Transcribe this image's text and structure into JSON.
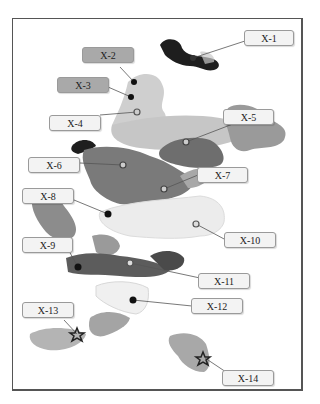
{
  "map": {
    "type": "schematic-region-map",
    "colors": {
      "black": "#1e1e1e",
      "dark_gray": "#6e6e6e",
      "mid_gray": "#8c8c8c",
      "light_gray": "#b4b4b4",
      "pale_gray": "#d2d2d2",
      "very_pale": "#ececec"
    },
    "markers": [
      {
        "id": "X-1",
        "label": "X-1",
        "symbol": "dark-circle",
        "label_style": "light"
      },
      {
        "id": "X-2",
        "label": "X-2",
        "symbol": "black-dot",
        "label_style": "dark"
      },
      {
        "id": "X-3",
        "label": "X-3",
        "symbol": "black-dot",
        "label_style": "dark"
      },
      {
        "id": "X-4",
        "label": "X-4",
        "symbol": "ring",
        "label_style": "light"
      },
      {
        "id": "X-5",
        "label": "X-5",
        "symbol": "ring",
        "label_style": "light"
      },
      {
        "id": "X-6",
        "label": "X-6",
        "symbol": "ring",
        "label_style": "light"
      },
      {
        "id": "X-7",
        "label": "X-7",
        "symbol": "ring",
        "label_style": "light"
      },
      {
        "id": "X-8",
        "label": "X-8",
        "symbol": "black-dot",
        "label_style": "light"
      },
      {
        "id": "X-9",
        "label": "X-9",
        "symbol": "black-dot",
        "label_style": "light"
      },
      {
        "id": "X-10",
        "label": "X-10",
        "symbol": "ring",
        "label_style": "light"
      },
      {
        "id": "X-11",
        "label": "X-11",
        "symbol": "ring",
        "label_style": "light"
      },
      {
        "id": "X-12",
        "label": "X-12",
        "symbol": "black-dot",
        "label_style": "light"
      },
      {
        "id": "X-13",
        "label": "X-13",
        "symbol": "star",
        "label_style": "light"
      },
      {
        "id": "X-14",
        "label": "X-14",
        "symbol": "star",
        "label_style": "light"
      }
    ]
  }
}
